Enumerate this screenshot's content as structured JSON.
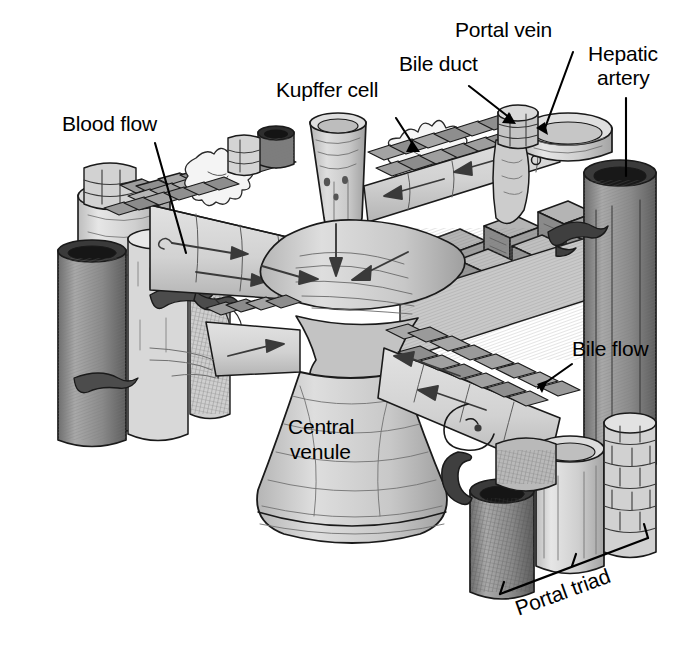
{
  "figure": {
    "type": "anatomical-illustration",
    "style": "grayscale pen-and-ink line drawing",
    "width_px": 678,
    "height_px": 647,
    "background_color": "#ffffff",
    "ink_color": "#000000"
  },
  "labels": {
    "blood_flow": "Blood flow",
    "kupffer_cell": "Kupffer cell",
    "bile_duct": "Bile duct",
    "portal_vein": "Portal vein",
    "hepatic_artery_line1": "Hepatic",
    "hepatic_artery_line2": "artery",
    "bile_flow": "Bile flow",
    "central_venule_line1": "Central",
    "central_venule_line2": "venule",
    "portal_triad": "Portal triad"
  },
  "palette": {
    "ink": "#000000",
    "paper": "#ffffff",
    "tissue_light": "#d6d6d6",
    "tissue_mid": "#b9b9b9",
    "tissue_dark": "#9a9a9a",
    "vessel_dark": "#8c8c8c",
    "hatch": "#6f6f6f",
    "highlight": "#eaeaea"
  },
  "structures": [
    {
      "name": "central-venule",
      "label": "Central venule",
      "role": "collecting vein at lobule center"
    },
    {
      "name": "portal-vein",
      "label": "Portal vein",
      "role": "portal triad vessel, largest"
    },
    {
      "name": "hepatic-artery",
      "label": "Hepatic artery",
      "role": "portal triad vessel, dark hatched"
    },
    {
      "name": "bile-duct",
      "label": "Bile duct",
      "role": "portal triad duct, small cobbled tube"
    },
    {
      "name": "kupffer-cell",
      "label": "Kupffer cell",
      "role": "stellate macrophage in sinusoid"
    },
    {
      "name": "hepatocyte-plate",
      "label": "Hepatocyte plates",
      "role": "brick-like cell cords radiating from center"
    },
    {
      "name": "sinusoid",
      "label": "Sinusoid",
      "role": "blood channel between plates"
    },
    {
      "name": "portal-triad",
      "label": "Portal triad",
      "role": "grouping of portal vein, hepatic artery, bile duct"
    }
  ],
  "flow_arrows": {
    "blood_direction": "inward toward central venule",
    "bile_direction": "outward toward portal triad",
    "blood_arrow_count": 8,
    "bile_arrow_count": 6
  }
}
